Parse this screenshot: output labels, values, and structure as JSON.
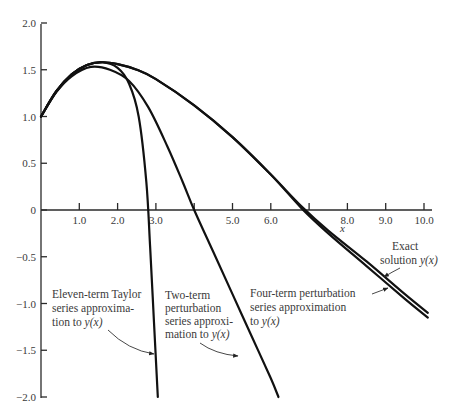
{
  "chart_data": {
    "type": "line",
    "title": "",
    "xlabel": "x",
    "ylabel": "",
    "xlim": [
      0,
      10.2
    ],
    "ylim": [
      -2.0,
      2.0
    ],
    "grid": false,
    "legend": "annotations",
    "x_ticks": [
      1,
      2,
      3,
      4,
      5,
      6,
      7,
      8,
      9,
      10
    ],
    "x_tick_labels": [
      "1.0",
      "2.0",
      "3.0",
      "",
      "5.0",
      "6.0",
      "",
      "8.0",
      "9.0",
      "10.0"
    ],
    "y_ticks": [
      2.0,
      1.5,
      1.0,
      0.5,
      0,
      -0.5,
      -1.0,
      -1.5,
      -2.0
    ],
    "y_tick_labels": [
      "2.0",
      "1.5",
      "1.0",
      "0.5",
      "0",
      "-0.5",
      "-1.0",
      "-1.5",
      "-2.0"
    ],
    "series": [
      {
        "name": "Exact solution y(x)",
        "x": [
          0,
          0.4,
          0.8,
          1.2,
          1.6,
          2.0,
          2.5,
          3.0,
          4.0,
          5.0,
          6.0,
          6.8,
          7.5,
          8.5,
          9.5,
          10.1
        ],
        "y": [
          1.0,
          1.27,
          1.45,
          1.55,
          1.58,
          1.56,
          1.5,
          1.4,
          1.12,
          0.78,
          0.38,
          0.04,
          -0.22,
          -0.55,
          -0.9,
          -1.1
        ]
      },
      {
        "name": "Four-term perturbation series approximation to y(x)",
        "x": [
          0,
          0.4,
          0.8,
          1.2,
          1.6,
          2.0,
          2.5,
          3.0,
          4.0,
          5.0,
          6.0,
          6.8,
          7.5,
          8.5,
          9.5,
          10.1
        ],
        "y": [
          1.0,
          1.27,
          1.45,
          1.55,
          1.58,
          1.56,
          1.5,
          1.4,
          1.12,
          0.78,
          0.38,
          0.02,
          -0.25,
          -0.6,
          -0.95,
          -1.15
        ]
      },
      {
        "name": "Eleven-term Taylor series approximation to y(x)",
        "x": [
          0,
          0.4,
          0.8,
          1.2,
          1.6,
          2.0,
          2.3,
          2.55,
          2.75,
          2.85,
          2.95,
          3.05
        ],
        "y": [
          1.0,
          1.27,
          1.45,
          1.55,
          1.58,
          1.52,
          1.35,
          1.0,
          0.3,
          -0.4,
          -1.2,
          -2.0
        ]
      },
      {
        "name": "Two-term perturbation series approximation to y(x)",
        "x": [
          0,
          0.4,
          0.8,
          1.3,
          1.8,
          2.3,
          2.8,
          3.3,
          3.7,
          4.0,
          4.5,
          5.0,
          5.5,
          6.0,
          6.2
        ],
        "y": [
          1.0,
          1.26,
          1.43,
          1.53,
          1.5,
          1.38,
          1.1,
          0.68,
          0.3,
          0.0,
          -0.45,
          -0.9,
          -1.35,
          -1.8,
          -2.0
        ]
      }
    ],
    "annotations": [
      {
        "lines": [
          "Exact",
          "solution y(x)"
        ],
        "points_to": "Exact solution y(x)"
      },
      {
        "lines": [
          "Four-term perturbation",
          "series approximation",
          "to y(x)"
        ],
        "points_to": "Four-term perturbation series"
      },
      {
        "lines": [
          "Eleven-term Taylor",
          "series approxima-",
          "tion to y(x)"
        ],
        "points_to": "Eleven-term Taylor series"
      },
      {
        "lines": [
          "Two-term",
          "perturbation",
          "series approxi-",
          "mation to y(x)"
        ],
        "points_to": "Two-term perturbation series"
      }
    ]
  },
  "labels": {
    "x_axis": "x",
    "exact_1": "Exact",
    "exact_2": "solution ",
    "exact_2i": "y(x)",
    "four_1": "Four-term perturbation",
    "four_2": "series approximation",
    "four_3": "to ",
    "four_3i": "y(x)",
    "taylor_1": "Eleven-term Taylor",
    "taylor_2": "series approxima-",
    "taylor_3": "tion to ",
    "taylor_3i": "y(x)",
    "two_1": "Two-term",
    "two_2": "perturbation",
    "two_3": "series approxi-",
    "two_4": "mation to ",
    "two_4i": "y(x)"
  }
}
